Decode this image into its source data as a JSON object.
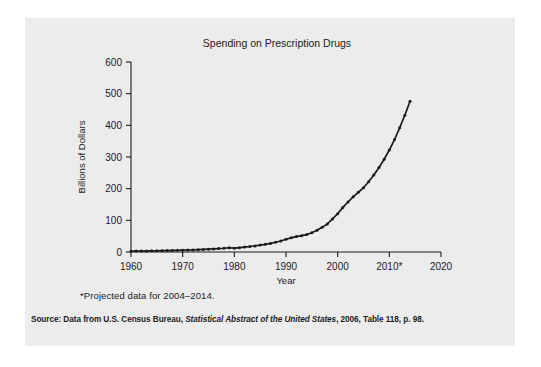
{
  "figure": {
    "background_color": "#ececec",
    "page_color": "#ffffff",
    "ink_color": "#1b1b1b"
  },
  "footnote": "*Projected data for 2004–2014.",
  "source": {
    "prefix": "Source: Data from U.S. Census Bureau, ",
    "italic": "Statistical Abstract of the United States",
    "suffix": ", 2006, Table 118, p. 98."
  },
  "chart_data": {
    "type": "line",
    "title": "Spending on Prescription Drugs",
    "xlabel": "Year",
    "ylabel": "Billions of Dollars",
    "xlim": [
      1960,
      2020
    ],
    "ylim": [
      0,
      600
    ],
    "grid": false,
    "legend": "none",
    "marker": "circle",
    "line_color": "#1b1b1b",
    "xticks": [
      1960,
      1970,
      1980,
      1990,
      2000,
      2010,
      2020
    ],
    "xticklabels": [
      "1960",
      "1970",
      "1980",
      "1990",
      "2000",
      "2010*",
      "2020"
    ],
    "yticks": [
      0,
      100,
      200,
      300,
      400,
      500,
      600
    ],
    "yticklabels": [
      "0",
      "100",
      "200",
      "300",
      "400",
      "500",
      "600"
    ],
    "x": [
      1960,
      1961,
      1962,
      1963,
      1964,
      1965,
      1966,
      1967,
      1968,
      1969,
      1970,
      1971,
      1972,
      1973,
      1974,
      1975,
      1976,
      1977,
      1978,
      1979,
      1980,
      1981,
      1982,
      1983,
      1984,
      1985,
      1986,
      1987,
      1988,
      1989,
      1990,
      1991,
      1992,
      1993,
      1994,
      1995,
      1996,
      1997,
      1998,
      1999,
      2000,
      2001,
      2002,
      2003,
      2004,
      2005,
      2006,
      2007,
      2008,
      2009,
      2010,
      2011,
      2012,
      2013,
      2014
    ],
    "values": [
      2.7,
      2.9,
      3.1,
      3.3,
      3.6,
      3.9,
      4.2,
      4.5,
      4.9,
      5.4,
      5.9,
      6.3,
      6.7,
      7.3,
      8.0,
      8.8,
      9.8,
      10.8,
      11.9,
      13.4,
      12.0,
      13.7,
      15.4,
      17.3,
      19.2,
      21.8,
      24.3,
      27.2,
      30.8,
      34.7,
      40.3,
      44.8,
      48.8,
      51.7,
      55.0,
      60.8,
      68.5,
      77.8,
      88.5,
      104.4,
      120.9,
      140.8,
      157.9,
      174.2,
      188.5,
      203.0,
      222.0,
      243.0,
      267.0,
      293.0,
      322.0,
      355.0,
      392.0,
      432.0,
      476.0
    ]
  }
}
